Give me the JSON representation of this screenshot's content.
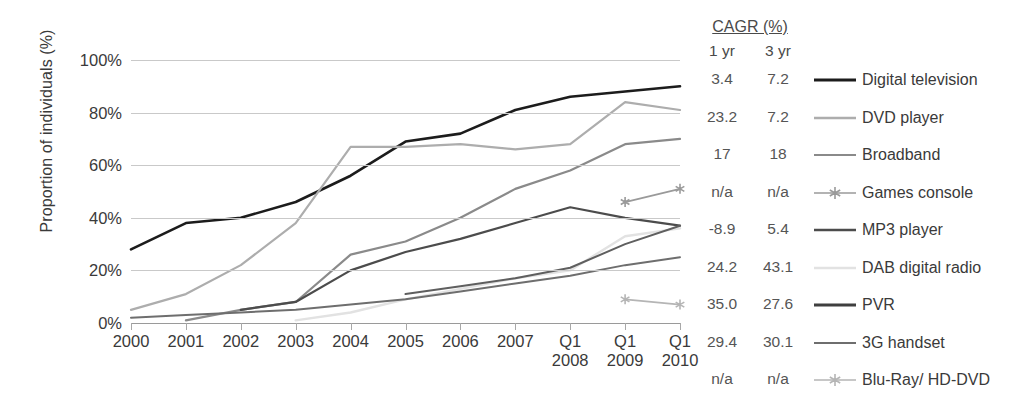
{
  "chart_data": {
    "type": "line",
    "title": "",
    "xlabel": "",
    "ylabel": "Proportion of individuals (%)",
    "ylim": [
      0,
      100
    ],
    "ytick_labels": [
      "0%",
      "20%",
      "40%",
      "60%",
      "80%",
      "100%"
    ],
    "ytick_values": [
      0,
      20,
      40,
      60,
      80,
      100
    ],
    "grid": true,
    "legend_position": "right",
    "categories": [
      "2000",
      "2001",
      "2002",
      "2003",
      "2004",
      "2005",
      "2006",
      "2007",
      "Q1 2008",
      "Q1 2009",
      "Q1 2010"
    ],
    "x_tick_lines": [
      {
        "l1": "2000",
        "l2": ""
      },
      {
        "l1": "2001",
        "l2": ""
      },
      {
        "l1": "2002",
        "l2": ""
      },
      {
        "l1": "2003",
        "l2": ""
      },
      {
        "l1": "2004",
        "l2": ""
      },
      {
        "l1": "2005",
        "l2": ""
      },
      {
        "l1": "2006",
        "l2": ""
      },
      {
        "l1": "2007",
        "l2": ""
      },
      {
        "l1": "Q1",
        "l2": "2008"
      },
      {
        "l1": "Q1",
        "l2": "2009"
      },
      {
        "l1": "Q1",
        "l2": "2010"
      }
    ],
    "series": [
      {
        "name": "Digital television",
        "color": "#1c1c1c",
        "width": 2.6,
        "marker": "none",
        "values": [
          28,
          38,
          40,
          46,
          56,
          69,
          72,
          81,
          86,
          88,
          90
        ]
      },
      {
        "name": "DVD player",
        "color": "#adadad",
        "width": 2.2,
        "marker": "none",
        "values": [
          5,
          11,
          22,
          38,
          67,
          67,
          68,
          66,
          68,
          84,
          81
        ]
      },
      {
        "name": "Broadband",
        "color": "#8a8a8a",
        "width": 2.2,
        "marker": "none",
        "values": [
          null,
          1,
          5,
          8,
          26,
          31,
          40,
          51,
          58,
          68,
          70
        ]
      },
      {
        "name": "Games console",
        "color": "#9a9a9a",
        "width": 1.8,
        "marker": "star",
        "values": [
          null,
          null,
          null,
          null,
          null,
          null,
          null,
          null,
          null,
          46,
          51
        ]
      },
      {
        "name": "MP3 player",
        "color": "#4c4c4c",
        "width": 2.2,
        "marker": "none",
        "values": [
          null,
          null,
          5,
          8,
          20,
          27,
          32,
          38,
          44,
          40,
          37
        ]
      },
      {
        "name": "DAB digital radio",
        "color": "#e2e2e2",
        "width": 2.4,
        "marker": "none",
        "values": [
          null,
          null,
          null,
          1,
          4,
          9,
          13,
          17,
          20,
          33,
          36
        ]
      },
      {
        "name": "PVR",
        "color": "#5f5f5f",
        "width": 2.0,
        "marker": "none",
        "values": [
          null,
          null,
          null,
          null,
          null,
          11,
          14,
          17,
          21,
          30,
          37
        ]
      },
      {
        "name": "3G handset",
        "color": "#6e6e6e",
        "width": 2.0,
        "marker": "none",
        "values": [
          2,
          3,
          4,
          5,
          7,
          9,
          12,
          15,
          18,
          22,
          25
        ]
      },
      {
        "name": "Blu-Ray/ HD-DVD",
        "color": "#b5b5b5",
        "width": 1.8,
        "marker": "star",
        "values": [
          null,
          null,
          null,
          null,
          null,
          null,
          null,
          null,
          null,
          9,
          7
        ]
      }
    ]
  },
  "cagr": {
    "title": "CAGR (%)",
    "col1_header": "1 yr",
    "col2_header": "3 yr",
    "rows": [
      {
        "one_yr": "3.4",
        "three_yr": "7.2"
      },
      {
        "one_yr": "23.2",
        "three_yr": "7.2"
      },
      {
        "one_yr": "17",
        "three_yr": "18"
      },
      {
        "one_yr": "n/a",
        "three_yr": "n/a"
      },
      {
        "one_yr": "-8.9",
        "three_yr": "5.4"
      },
      {
        "one_yr": "24.2",
        "three_yr": "43.1"
      },
      {
        "one_yr": "35.0",
        "three_yr": "27.6"
      },
      {
        "one_yr": "29.4",
        "three_yr": "30.1"
      },
      {
        "one_yr": "n/a",
        "three_yr": "n/a"
      }
    ]
  },
  "legend": {
    "items": [
      {
        "label": "Digital television",
        "color": "#1c1c1c",
        "width": 2.8,
        "marker": "none"
      },
      {
        "label": "DVD player",
        "color": "#adadad",
        "width": 2.4,
        "marker": "none"
      },
      {
        "label": "Broadband",
        "color": "#8a8a8a",
        "width": 2.0,
        "marker": "none"
      },
      {
        "label": "Games console",
        "color": "#9a9a9a",
        "width": 1.6,
        "marker": "star"
      },
      {
        "label": "MP3 player",
        "color": "#4c4c4c",
        "width": 2.4,
        "marker": "none"
      },
      {
        "label": "DAB digital radio",
        "color": "#e2e2e2",
        "width": 2.6,
        "marker": "none"
      },
      {
        "label": "PVR",
        "color": "#3f3f3f",
        "width": 3.0,
        "marker": "none"
      },
      {
        "label": "3G handset",
        "color": "#6e6e6e",
        "width": 2.2,
        "marker": "none"
      },
      {
        "label": "Blu-Ray/ HD-DVD",
        "color": "#b5b5b5",
        "width": 1.6,
        "marker": "star"
      }
    ]
  }
}
